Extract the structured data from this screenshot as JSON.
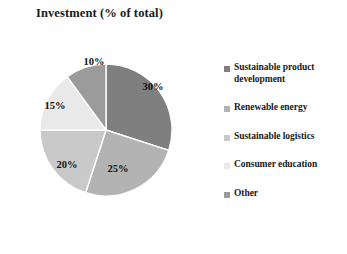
{
  "chart_data": {
    "type": "pie",
    "title": "Investment (% of total)",
    "xlabel": "",
    "ylabel": "",
    "categories": [
      "Sustainable product development",
      "Renewable energy",
      "Sustainable logistics",
      "Consumer education",
      "Other"
    ],
    "values": [
      30,
      25,
      20,
      15,
      10
    ],
    "value_labels": [
      "30%",
      "25%",
      "20%",
      "15%",
      "10%"
    ],
    "colors": [
      "#7f7f7f",
      "#b3b3b3",
      "#c9c9c9",
      "#e9e9e9",
      "#9b9b9b"
    ],
    "legend_position": "right",
    "grid": false,
    "start_angle_deg": 0,
    "direction": "clockwise",
    "slice_border_color": "#ffffff"
  },
  "legend": {
    "items": [
      {
        "label": "Sustainable product development",
        "color": "#7f7f7f"
      },
      {
        "label": "Renewable energy",
        "color": "#b3b3b3"
      },
      {
        "label": "Sustainable logistics",
        "color": "#c9c9c9"
      },
      {
        "label": "Consumer education",
        "color": "#e9e9e9"
      },
      {
        "label": "Other",
        "color": "#9b9b9b"
      }
    ]
  },
  "slice_labels": [
    {
      "text": "30%",
      "x": 153,
      "y": 86
    },
    {
      "text": "25%",
      "x": 118,
      "y": 168
    },
    {
      "text": "20%",
      "x": 67,
      "y": 164
    },
    {
      "text": "15%",
      "x": 55,
      "y": 105
    },
    {
      "text": "10%",
      "x": 94,
      "y": 61
    }
  ]
}
